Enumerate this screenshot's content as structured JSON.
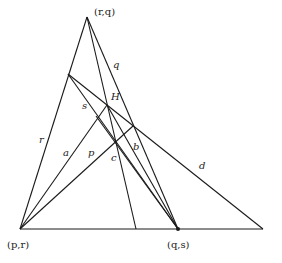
{
  "diagram": {
    "points": {
      "apex": {
        "label": "(r,q)",
        "x": 87,
        "y": 17
      },
      "bottom_left": {
        "label": "(p,r)",
        "x": 20,
        "y": 229
      },
      "bottom_mid": {
        "label": "(q,s)",
        "x": 178,
        "y": 229
      },
      "H": {
        "label": "H",
        "x": 107,
        "y": 105
      }
    },
    "line_labels": {
      "q": "q",
      "r": "r",
      "s": "s",
      "a": "a",
      "p": "p",
      "c": "c",
      "b": "b",
      "d": "d"
    },
    "lines": [
      {
        "name": "r",
        "x1": 20,
        "y1": 229,
        "x2": 87,
        "y2": 17
      },
      {
        "name": "q",
        "x1": 87,
        "y1": 17,
        "x2": 178,
        "y2": 229
      },
      {
        "name": "apex-vertical",
        "x1": 87,
        "y1": 17,
        "x2": 136,
        "y2": 229
      },
      {
        "name": "base",
        "x1": 20,
        "y1": 229,
        "x2": 263,
        "y2": 229
      },
      {
        "name": "d",
        "x1": 68,
        "y1": 74,
        "x2": 263,
        "y2": 229
      },
      {
        "name": "s",
        "x1": 68,
        "y1": 74,
        "x2": 178,
        "y2": 229
      },
      {
        "name": "a",
        "x1": 20,
        "y1": 229,
        "x2": 107,
        "y2": 105
      },
      {
        "name": "p",
        "x1": 20,
        "y1": 229,
        "x2": 133,
        "y2": 126
      },
      {
        "name": "c",
        "x1": 107,
        "y1": 105,
        "x2": 178,
        "y2": 229
      },
      {
        "name": "b",
        "x1": 96,
        "y1": 116,
        "x2": 178,
        "y2": 229
      }
    ],
    "stroke_color": "#1a1a1a"
  }
}
